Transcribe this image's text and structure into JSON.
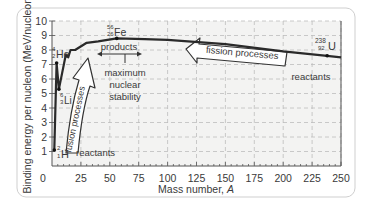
{
  "chart_data": {
    "type": "line",
    "title": "",
    "xlabel": "Mass number, A",
    "ylabel": "Binding energy per nucleon (MeV/nucleon)",
    "xlim": [
      0,
      250
    ],
    "ylim": [
      0,
      10
    ],
    "x_ticks": [
      "0",
      "25",
      "50",
      "75",
      "100",
      "125",
      "150",
      "175",
      "200",
      "225",
      "250"
    ],
    "y_ticks": [
      "1",
      "2",
      "3",
      "4",
      "5",
      "6",
      "7",
      "8",
      "9",
      "10"
    ],
    "grid": true,
    "series": [
      {
        "name": "Binding energy per nucleon",
        "points": [
          {
            "A": 2,
            "E": 1.1
          },
          {
            "A": 4,
            "E": 7.1
          },
          {
            "A": 6,
            "E": 5.3
          },
          {
            "A": 12,
            "E": 7.7
          },
          {
            "A": 14,
            "E": 7.5
          },
          {
            "A": 16,
            "E": 8.0
          },
          {
            "A": 20,
            "E": 8.0
          },
          {
            "A": 30,
            "E": 8.5
          },
          {
            "A": 40,
            "E": 8.6
          },
          {
            "A": 56,
            "E": 8.8
          },
          {
            "A": 80,
            "E": 8.75
          },
          {
            "A": 100,
            "E": 8.7
          },
          {
            "A": 150,
            "E": 8.4
          },
          {
            "A": 200,
            "E": 7.9
          },
          {
            "A": 238,
            "E": 7.6
          },
          {
            "A": 250,
            "E": 7.5
          }
        ]
      }
    ],
    "annotations": [
      {
        "label": "H",
        "mass": "2",
        "atomic": "1",
        "A": 2,
        "E": 1.1
      },
      {
        "label": "He",
        "mass": "4",
        "atomic": "2",
        "A": 4,
        "E": 7.1
      },
      {
        "label": "Li",
        "mass": "6",
        "atomic": "3",
        "A": 6,
        "E": 5.3
      },
      {
        "label": "Fe",
        "mass": "56",
        "atomic": "26",
        "A": 56,
        "E": 8.8
      },
      {
        "label": "U",
        "mass": "238",
        "atomic": "92",
        "A": 238,
        "E": 7.6
      }
    ],
    "text_annotations": [
      "products",
      "maximum nuclear stability",
      "fusion processes",
      "fission processes",
      "reactants",
      "reactants"
    ]
  },
  "labels": {
    "xlabel": "Mass number, ",
    "xlabel_var": "A",
    "ylabel": "Binding energy per nucleon (MeV/nucleon)",
    "products": "products",
    "max1": "maximum",
    "max2": "nuclear",
    "max3": "stability",
    "fusion": "fusion processes",
    "fission": "fission processes",
    "reactants_left": "reactants",
    "reactants_right": "reactants",
    "H": {
      "sym": "H",
      "mass": "2",
      "z": "1"
    },
    "He": {
      "sym": "He",
      "mass": "4",
      "z": "2"
    },
    "Li": {
      "sym": "Li",
      "mass": "6",
      "z": "3"
    },
    "Fe": {
      "sym": "Fe",
      "mass": "56",
      "z": "26"
    },
    "U": {
      "sym": "U",
      "mass": "238",
      "z": "92"
    }
  }
}
